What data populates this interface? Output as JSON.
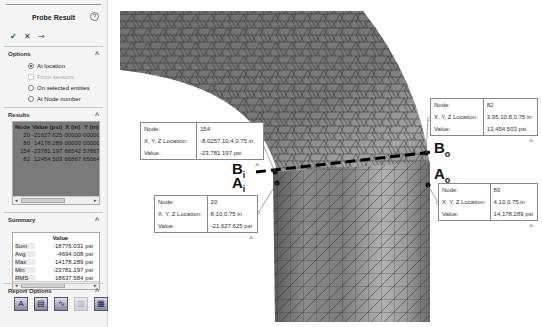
{
  "panel": {
    "title": "Probe Result",
    "help_icon": "question-circle-icon",
    "actions": [
      {
        "name": "ok",
        "glyph": "✔"
      },
      {
        "name": "cancel",
        "glyph": "✕"
      },
      {
        "name": "pin",
        "glyph": "⊸"
      }
    ],
    "options": {
      "header": "Options",
      "items": [
        {
          "label": "At location",
          "selected": true,
          "enabled": true
        },
        {
          "label": "From sensors",
          "selected": false,
          "enabled": false
        },
        {
          "label": "On selected entities",
          "selected": false,
          "enabled": true
        },
        {
          "label": "At Node number",
          "selected": false,
          "enabled": true
        }
      ]
    },
    "results": {
      "header": "Results",
      "columns": [
        "Node",
        "Value (psi)",
        "X (in)",
        "Y (in)"
      ],
      "rows": [
        [
          "20",
          "-21627.625",
          "00000",
          "00000"
        ],
        [
          "80",
          "14178.289",
          "00000",
          "00000"
        ],
        [
          "154",
          "-23781.197",
          "66542",
          "57867"
        ],
        [
          "82",
          "12454.503",
          "66867",
          "65064"
        ]
      ]
    },
    "summary": {
      "header": "Summary",
      "column": "Value",
      "rows": [
        [
          "Sum",
          "-18776.031",
          "psi"
        ],
        [
          "Avg",
          "-4694.008",
          "psi"
        ],
        [
          "Max",
          "14178.289",
          "psi"
        ],
        [
          "Min",
          "-23781.197",
          "psi"
        ],
        [
          "RMS",
          "18637.584",
          "psi"
        ]
      ]
    },
    "report_options": {
      "header": "Report Options",
      "icons": [
        "save-as-sensor-icon",
        "save-to-file-icon",
        "plot-icon",
        "plot-disabled-icon",
        "report-icon"
      ]
    }
  },
  "callouts": [
    {
      "id": "B_i",
      "node_label": "Node:",
      "node": "154",
      "loc_label": "X, Y, Z Location:",
      "loc": "-8.0257,10.4,0.75 in",
      "val_label": "Value:",
      "value": "-23,781.197 psi"
    },
    {
      "id": "A_i",
      "node_label": "Node:",
      "node": "20",
      "loc_label": "X, Y, Z Location:",
      "loc": "8,10,0.75 in",
      "val_label": "Value:",
      "value": "-21,627.625 psi"
    },
    {
      "id": "B_o",
      "node_label": "Node:",
      "node": "82",
      "loc_label": "X, Y, Z Location:",
      "loc": "3.95,10.8,0.75 in",
      "val_label": "Value:",
      "value": "12,454.503 psi"
    },
    {
      "id": "A_o",
      "node_label": "Node:",
      "node": "80",
      "loc_label": "X, Y, Z Location:",
      "loc": "4,10,0.75 in",
      "val_label": "Value:",
      "value": "14,178.289 psi"
    }
  ],
  "point_labels": {
    "Bi": {
      "main": "B",
      "sub": "i"
    },
    "Ai": {
      "main": "A",
      "sub": "i"
    },
    "Bo": {
      "main": "B",
      "sub": "o"
    },
    "Ao": {
      "main": "A",
      "sub": "o"
    }
  },
  "caret_glyph": "^"
}
